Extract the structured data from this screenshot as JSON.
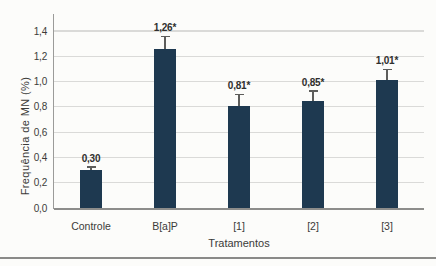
{
  "chart_data": {
    "type": "bar",
    "title": "",
    "xlabel": "Tratamentos",
    "ylabel": "Frequência de MN (%)",
    "categories": [
      "Controle",
      "B[a]P",
      "[1]",
      "[2]",
      "[3]"
    ],
    "values": [
      0.3,
      1.26,
      0.81,
      0.85,
      1.01
    ],
    "value_labels": [
      "0,30",
      "1,26*",
      "0,81*",
      "0,85*",
      "1,01*"
    ],
    "errors": [
      0.02,
      0.09,
      0.08,
      0.07,
      0.08
    ],
    "ylim": [
      0,
      1.4
    ],
    "ytick_step": 0.2,
    "ytick_labels": [
      "0,0",
      "0,2",
      "0,4",
      "0,6",
      "0,8",
      "1,0",
      "1,2",
      "1,4"
    ],
    "grid": true,
    "decimal_separator": ",",
    "bar_color": "#1e3950"
  }
}
